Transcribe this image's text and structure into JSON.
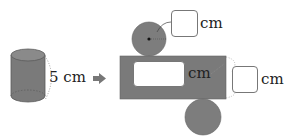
{
  "diagram": {
    "cylinder": {
      "height_label": "5 cm"
    },
    "arrow": {
      "icon": "right-arrow-icon"
    },
    "net": {
      "top_circle_radius": {
        "answer_box": "",
        "unit": "cm"
      },
      "rectangle_width": {
        "answer_box": "",
        "unit": "cm"
      },
      "rectangle_height": {
        "answer_box": "",
        "unit": "cm"
      }
    },
    "colors": {
      "fill": "#7d7d7d",
      "fill_dark": "#6a6a6a",
      "stroke": "#555555",
      "box_border": "#777777"
    }
  }
}
